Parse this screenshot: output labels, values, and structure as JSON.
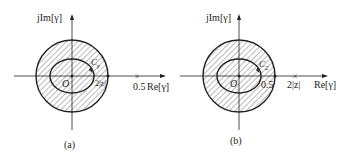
{
  "panels": [
    {
      "id": "a",
      "caption": "(a)",
      "y_axis_label": "jIm[γ]",
      "x_axis_label": "Re[γ]",
      "origin_label": "O",
      "contour_label": "C",
      "contour_subscript": "γ",
      "inner_point_label": "2|z|",
      "outer_point_label": "0.5"
    },
    {
      "id": "b",
      "caption": "(b)",
      "y_axis_label": "jIm[γ]",
      "x_axis_label": "Re[γ]",
      "origin_label": "O",
      "contour_label": "C",
      "contour_subscript": "2",
      "inner_point_label": "0.5",
      "outer_point_label": "2|z|"
    }
  ],
  "colors": {
    "line": "#222222",
    "hatch": "#555555"
  }
}
